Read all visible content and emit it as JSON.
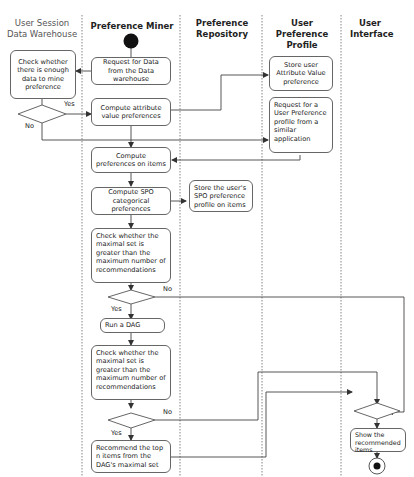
{
  "lanes": [
    {
      "title": "User Session Data Warehouse"
    },
    {
      "title": "Preference Miner"
    },
    {
      "title": "Preference Repository"
    },
    {
      "title": "User Preference Profile"
    },
    {
      "title": "User Interface"
    }
  ],
  "nodes": {
    "check_enough_data": "Check whether there is enough data to mine preference",
    "request_data": "Request for Data from the Data warehouse",
    "compute_attribute": "Compute attribute value preferences",
    "store_attribute": "Store user Attribute Value preference",
    "request_profile": "Request for a User Preference profile from a similar application",
    "compute_items": "Compute preferences on items",
    "compute_spo": "Compute SPO categorical preferences",
    "store_spo": "Store the user's SPO preference profile on items",
    "check_maximal_1": "Check whether the maximal set is greater than the maximum number of recommendations",
    "run_dag": "Run a DAG",
    "check_maximal_2": "Check whether the maximal set is greater than the maximum number of recommendations",
    "recommend_top": "Recommend the top n items from the DAG's maximal set",
    "show_items": "Show the recommended items"
  },
  "edge_labels": {
    "yes_1": "Yes",
    "no_1": "No",
    "no_2": "No",
    "yes_2": "Yes",
    "no_3": "No",
    "yes_3": "Yes"
  }
}
